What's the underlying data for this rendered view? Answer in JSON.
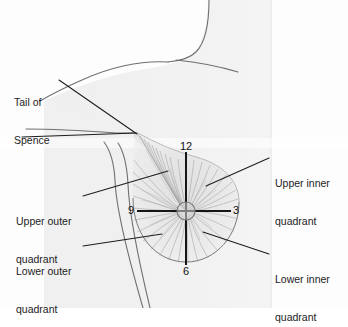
{
  "figure": {
    "background_color": "#fdfdfd",
    "body_fill_color": "#f1f1f1",
    "outline_color": "#6a6a6a",
    "duct_color": "#9a9a9a",
    "leader_color": "#1d1d1d",
    "text_color": "#1c1c1c"
  },
  "labels": {
    "tail_of_spence": {
      "line1": "Tail of",
      "line2": "Spence",
      "x": 14,
      "y": 77
    },
    "upper_outer": {
      "line1": "Upper outer",
      "line2": "quadrant",
      "x": 16,
      "y": 196
    },
    "lower_outer": {
      "line1": "Lower outer",
      "line2": "quadrant",
      "x": 16,
      "y": 246
    },
    "upper_inner": {
      "line1": "Upper inner",
      "line2": "quadrant",
      "x": 274,
      "y": 155
    },
    "lower_inner": {
      "line1": "Lower inner",
      "line2": "quadrant",
      "x": 274,
      "y": 252
    }
  },
  "clock_positions": [
    {
      "id": "twelve",
      "value": "12",
      "x": 179,
      "y": 142
    },
    {
      "id": "three",
      "value": "3",
      "x": 233,
      "y": 205
    },
    {
      "id": "nine",
      "value": "9",
      "x": 128,
      "y": 205
    },
    {
      "id": "six",
      "value": "6",
      "x": 183,
      "y": 267
    }
  ],
  "anatomy": {
    "nipple": {
      "cx": 186,
      "cy": 211,
      "r": 9
    },
    "breast_circle": {
      "cx": 186,
      "cy": 211,
      "r": 51
    },
    "axis_vertical": {
      "x": 186,
      "y1": 152,
      "y2": 265
    },
    "axis_horizontal": {
      "y": 211,
      "x1": 137,
      "x2": 231
    }
  }
}
